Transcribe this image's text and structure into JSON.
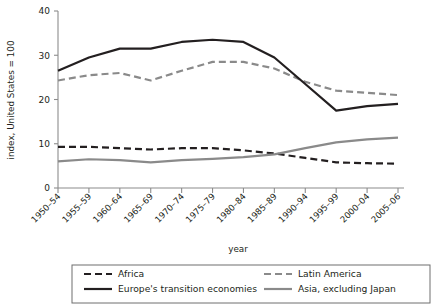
{
  "chart_data": {
    "type": "line",
    "title": "",
    "xlabel": "year",
    "ylabel": "index, United States = 100",
    "categories": [
      "1950–54",
      "1955–59",
      "1960–64",
      "1965–69",
      "1970–74",
      "1975–79",
      "1980–84",
      "1985–89",
      "1990–94",
      "1995–99",
      "2000–04",
      "2005–06"
    ],
    "ylim": [
      0,
      40
    ],
    "yticks": [
      0,
      10,
      20,
      30,
      40
    ],
    "ytick_labels": [
      "0",
      "10",
      "20",
      "30",
      "40"
    ],
    "grid": false,
    "legend_position": "bottom",
    "series": [
      {
        "name": "Africa",
        "style": "dashed",
        "color": "#231f20",
        "width": 2.2,
        "dash": "7,4",
        "values": [
          9.3,
          9.3,
          9.0,
          8.7,
          9.0,
          9.0,
          8.5,
          7.8,
          6.8,
          5.8,
          5.6,
          5.5
        ]
      },
      {
        "name": "Latin America",
        "style": "dashed",
        "color": "#8a8a8a",
        "width": 2.2,
        "dash": "7,4",
        "values": [
          24.3,
          25.5,
          26.0,
          24.3,
          26.5,
          28.5,
          28.5,
          27.0,
          24.0,
          22.0,
          21.5,
          21.0
        ]
      },
      {
        "name": "Europe's transition economies",
        "style": "solid",
        "color": "#231f20",
        "width": 2.2,
        "dash": "",
        "values": [
          26.5,
          29.5,
          31.5,
          31.5,
          33.0,
          33.5,
          33.0,
          29.5,
          23.5,
          17.5,
          18.5,
          19.0
        ]
      },
      {
        "name": "Asia, excluding Japan",
        "style": "solid",
        "color": "#8a8a8a",
        "width": 2.2,
        "dash": "",
        "values": [
          6.0,
          6.5,
          6.3,
          5.8,
          6.3,
          6.6,
          7.0,
          7.6,
          9.0,
          10.3,
          11.0,
          11.4
        ]
      }
    ]
  },
  "legend": {
    "entries": [
      {
        "label": "Africa"
      },
      {
        "label": "Latin America"
      },
      {
        "label": "Europe's transition economies"
      },
      {
        "label": "Asia, excluding Japan"
      }
    ]
  }
}
